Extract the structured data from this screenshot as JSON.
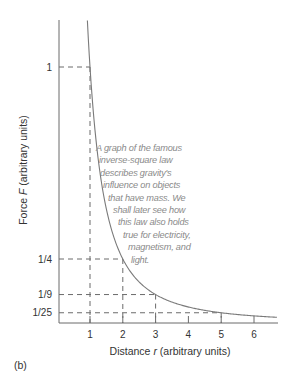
{
  "chart_data": {
    "type": "line",
    "title": "",
    "xlabel": "Distance r (arbitrary units)",
    "ylabel": "Force F (arbitrary units)",
    "xlabel_parts": {
      "before": "Distance ",
      "var": "r",
      "after": " (arbitrary units)"
    },
    "ylabel_parts": {
      "before": "Force ",
      "var": "F",
      "after": " (arbitrary units)"
    },
    "x_ticks": [
      1,
      2,
      3,
      4,
      5,
      6
    ],
    "y_ticks": [
      {
        "label": "1",
        "value": 1
      },
      {
        "label": "1/4",
        "value": 0.25
      },
      {
        "label": "1/9",
        "value": 0.1111
      },
      {
        "label": "1/25",
        "value": 0.04
      }
    ],
    "xlim": [
      0,
      6.8
    ],
    "ylim": [
      0,
      1.18
    ],
    "grid": false,
    "series": [
      {
        "name": "F = 1/r^2",
        "x": [
          0.92,
          1,
          1.25,
          1.5,
          2,
          2.5,
          3,
          3.5,
          4,
          4.5,
          5,
          5.5,
          6,
          6.7
        ],
        "values": [
          1.18,
          1,
          0.64,
          0.444,
          0.25,
          0.16,
          0.111,
          0.082,
          0.0625,
          0.049,
          0.04,
          0.033,
          0.028,
          0.022
        ]
      }
    ],
    "reference_lines": [
      {
        "r": 1,
        "F": "1"
      },
      {
        "r": 2,
        "F": "1/4"
      },
      {
        "r": 3,
        "F": "1/9"
      },
      {
        "r": 5,
        "F": "1/25"
      }
    ],
    "annotation": {
      "lines": [
        "A graph of the famous",
        "inverse-square law",
        "describes gravity's",
        "influence on objects",
        "that have mass. We",
        "shall later see how",
        "this law also holds",
        "true for electricity,",
        "magnetism, and",
        "light."
      ]
    },
    "panel_label": "(b)"
  },
  "colors": {
    "axis": "#6b6b6b",
    "curve": "#7a7a7a",
    "dashed": "#6b6b6b",
    "annotation_text": "#8a8a8a",
    "label_text": "#333333"
  }
}
